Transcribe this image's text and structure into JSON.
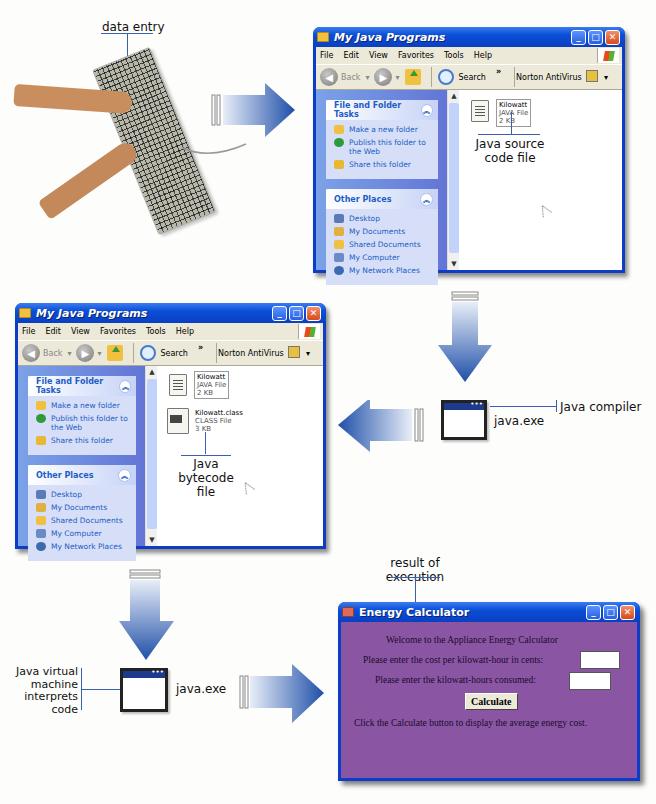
{
  "labels": {
    "data_entry": "data entry",
    "java_source_code_file": [
      "Java source",
      "code file"
    ],
    "java_compiler": "Java compiler",
    "compiler_exe": "java.exe",
    "java_bytecode_file": [
      "Java",
      "bytecode",
      "file"
    ],
    "jvm": [
      "Java virtual",
      "machine",
      "interprets",
      "code"
    ],
    "jvm_exe": "java.exe",
    "result": [
      "result of",
      "execution"
    ]
  },
  "explorer_window_1": {
    "title": "My Java Programs",
    "menu": [
      "File",
      "Edit",
      "View",
      "Favorites",
      "Tools",
      "Help"
    ],
    "toolbar": {
      "back": "Back",
      "search": "Search",
      "chevrons": "»",
      "norton": "Norton AntiVirus"
    },
    "panels": [
      {
        "title": "File and Folder Tasks",
        "items": [
          "Make a new folder",
          "Publish this folder to the Web",
          "Share this folder"
        ]
      },
      {
        "title": "Other Places",
        "items": [
          "Desktop",
          "My Documents",
          "Shared Documents",
          "My Computer",
          "My Network Places"
        ]
      }
    ],
    "files": [
      {
        "name": "Kilowatt",
        "type": "JAVA File",
        "size": "2 KB"
      }
    ]
  },
  "explorer_window_2": {
    "title": "My Java Programs",
    "menu": [
      "File",
      "Edit",
      "View",
      "Favorites",
      "Tools",
      "Help"
    ],
    "toolbar": {
      "back": "Back",
      "search": "Search",
      "chevrons": "»",
      "norton": "Norton AntiVirus"
    },
    "panels": [
      {
        "title": "File and Folder Tasks",
        "items": [
          "Make a new folder",
          "Publish this folder to the Web",
          "Share this folder"
        ]
      },
      {
        "title": "Other Places",
        "items": [
          "Desktop",
          "My Documents",
          "Shared Documents",
          "My Computer",
          "My Network Places"
        ]
      }
    ],
    "files": [
      {
        "name": "Kilowatt",
        "type": "JAVA File",
        "size": "2 KB"
      },
      {
        "name": "Kilowatt.class",
        "type": "CLASS File",
        "size": "3 KB"
      }
    ]
  },
  "energy_calculator": {
    "title": "Energy Calculator",
    "welcome": "Welcome to the Appliance Energy Calculator",
    "cost_prompt": "Please enter the cost per kilowatt-hour in cents:",
    "cost_value": "",
    "kwh_prompt": "Please enter the kilowatt-hours consumed:",
    "kwh_value": "",
    "calculate_label": "Calculate",
    "instructions": "Click the Calculate button to display the average energy cost."
  },
  "colors": {
    "arrow_blue": "#1f4fa8",
    "label_line": "#3a5fb0",
    "xp_title_blue": "#0a4fd6",
    "calculator_bg": "#8a56a4"
  }
}
